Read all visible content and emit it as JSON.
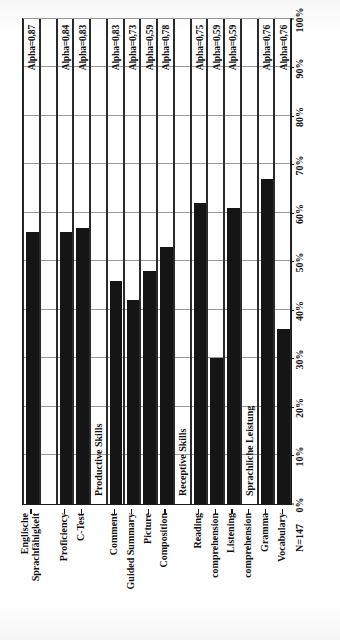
{
  "chart_data": {
    "type": "bar",
    "orientation": "horizontal",
    "title": "",
    "xlabel": "",
    "ylabel": "",
    "xlim": [
      0,
      100
    ],
    "grid": true,
    "legend": "none",
    "sample_size_label": "N=147",
    "value_unit": "%",
    "tick_labels": [
      "0%",
      "10%",
      "20%",
      "30%",
      "40%",
      "50%",
      "60%",
      "70%",
      "80%",
      "90%",
      "100%"
    ],
    "tick_values": [
      0,
      10,
      20,
      30,
      40,
      50,
      60,
      70,
      80,
      90,
      100
    ],
    "group_labels": [
      "Productive Skills",
      "Receptive Skills",
      "Sprachliche Leistung"
    ],
    "categories": [
      "Englische\nSprachfähigkeit",
      "",
      "Proficiency",
      "C-Test",
      "",
      "Comment",
      "Guided Summary",
      "Picture\nComposition",
      "",
      "Reading\ncomprehension",
      "",
      "Listening\ncomprehension",
      "",
      "Gramma",
      "Vocabulary"
    ],
    "values": [
      56,
      null,
      56,
      57,
      null,
      46,
      42,
      48,
      53,
      62,
      30,
      61,
      null,
      67,
      36
    ],
    "annotations": [
      "Alpha=0,87",
      "",
      "Alpha=0,84",
      "Alpha=0,83",
      "",
      "Alpha=0,83",
      "Alpha=0,73",
      "Alpha=0,59",
      "Alpha=0,78",
      "Alpha=0,75",
      "Alpha=0,59",
      "Alpha=0,59",
      "",
      "Alpha=0,76",
      "Alpha=0,76"
    ],
    "colors": {
      "bar": "#151515",
      "axis": "#1a1a1a",
      "grid": "#9a9a9a",
      "text": "#101010",
      "background": "#ffffff"
    },
    "rows": [
      {
        "label": "Englische\nSprachfähigkeit",
        "value": 56,
        "alpha": "Alpha=0,87",
        "group": ""
      },
      {
        "label": "",
        "value": null,
        "alpha": "",
        "group": ""
      },
      {
        "label": "Proficiency",
        "value": 56,
        "alpha": "Alpha=0,84",
        "group": ""
      },
      {
        "label": "C-Test",
        "value": 57,
        "alpha": "Alpha=0,83",
        "group": ""
      },
      {
        "label": "",
        "value": null,
        "alpha": "",
        "group": "Productive Skills"
      },
      {
        "label": "Comment",
        "value": 46,
        "alpha": "Alpha=0,83",
        "group": ""
      },
      {
        "label": "Guided Summary",
        "value": 42,
        "alpha": "Alpha=0,73",
        "group": ""
      },
      {
        "label": "Picture",
        "value": 48,
        "alpha": "Alpha=0,59",
        "group": ""
      },
      {
        "label": "Composition",
        "value": 53,
        "alpha": "Alpha=0,78",
        "group": ""
      },
      {
        "label": "",
        "value": null,
        "alpha": "",
        "group": "Receptive Skills"
      },
      {
        "label": "Reading",
        "value": 62,
        "alpha": "Alpha=0,75",
        "group": ""
      },
      {
        "label": "comprehension",
        "value": 30,
        "alpha": "Alpha=0,59",
        "group": ""
      },
      {
        "label": "Listening",
        "value": 61,
        "alpha": "Alpha=0,59",
        "group": ""
      },
      {
        "label": "comprehension",
        "value": null,
        "alpha": "",
        "group": "Sprachliche Leistung"
      },
      {
        "label": "Gramma",
        "value": 67,
        "alpha": "Alpha=0,76",
        "group": ""
      },
      {
        "label": "Vocabulary",
        "value": 36,
        "alpha": "Alpha=0,76",
        "group": ""
      }
    ]
  }
}
